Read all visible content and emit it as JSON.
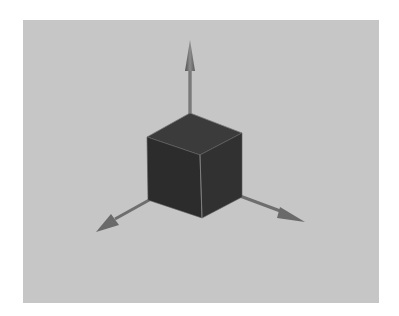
{
  "scene": {
    "background_color": "#c6c6c6",
    "page_color": "#ffffff",
    "cube": {
      "top_face_color": "#3b3b3b",
      "left_face_color": "#2c2c2c",
      "right_face_color": "#303030",
      "edge_highlight": "#8a8a8a"
    },
    "axes": [
      {
        "name": "up",
        "color": "#707070"
      },
      {
        "name": "left",
        "color": "#707070"
      },
      {
        "name": "right",
        "color": "#707070"
      }
    ]
  }
}
